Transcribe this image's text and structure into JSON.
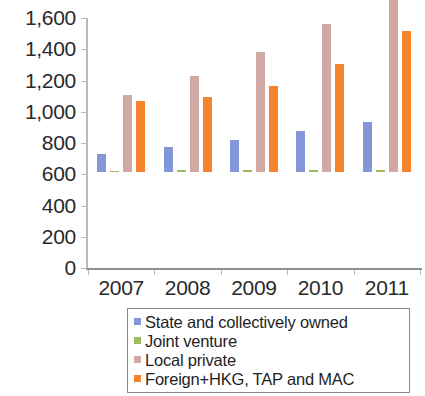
{
  "chart_data": {
    "type": "bar",
    "title": "",
    "subtitle": "",
    "xlabel": "",
    "ylabel": "",
    "categories": [
      "2007",
      "2008",
      "2009",
      "2010",
      "2011"
    ],
    "series": [
      {
        "name": "State and collectively owned",
        "color": "#8296d8",
        "values": [
          115,
          160,
          205,
          260,
          320
        ]
      },
      {
        "name": "Joint venture",
        "color": "#9cbb59",
        "values": [
          8,
          10,
          12,
          14,
          16
        ]
      },
      {
        "name": "Local private",
        "color": "#d0a8a4",
        "values": [
          490,
          615,
          770,
          945,
          1450
        ]
      },
      {
        "name": "Foreign+HKG, TAP and MAC",
        "color": "#f6832e",
        "values": [
          455,
          480,
          550,
          690,
          900
        ]
      }
    ],
    "ylim": [
      0,
      1600
    ],
    "y_ticks": [
      0,
      200,
      400,
      600,
      800,
      1000,
      1200,
      1400,
      1600
    ],
    "y_tick_labels": [
      "0",
      "200",
      "400",
      "600",
      "800",
      "1,000",
      "1,200",
      "1,400",
      "1,600"
    ],
    "grid": false,
    "legend_position": "bottom"
  },
  "legend": {
    "items": [
      {
        "label": "State and collectively owned",
        "color": "#8296d8"
      },
      {
        "label": "Joint venture",
        "color": "#9cbb59"
      },
      {
        "label": "Local private",
        "color": "#d0a8a4"
      },
      {
        "label": "Foreign+HKG, TAP and MAC",
        "color": "#f6832e"
      }
    ]
  }
}
